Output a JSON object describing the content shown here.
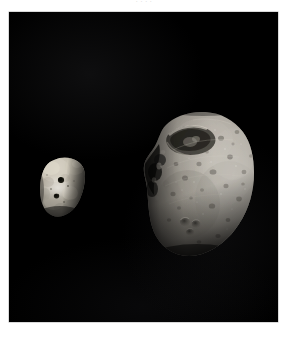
{
  "page": {
    "background_color": "#ffffff",
    "clipped_caption": ". .          . ."
  },
  "figure": {
    "panel_background": "#000000",
    "border_color": "#b4b4b4",
    "caption": "",
    "alt_description": "Two irregularly shaped moons of Mars photographed against black space: the smaller, smoother Deimos at left and the larger, heavily cratered Phobos at right.",
    "objects": [
      {
        "name": "Deimos",
        "role": "smaller-moon",
        "position": "left",
        "surface_tone": "#b9b4a8",
        "terminator_side": "right",
        "features": [
          "smooth-regolith",
          "two-dark-craters",
          "bright-upper-limb"
        ]
      },
      {
        "name": "Phobos",
        "role": "larger-moon",
        "position": "right",
        "surface_tone": "#a9a49c",
        "terminator_side": "left",
        "features": [
          "stickney-crater",
          "grooves",
          "heavy-cratering",
          "bright-right-limb",
          "shadowed-left-limb"
        ]
      }
    ]
  }
}
